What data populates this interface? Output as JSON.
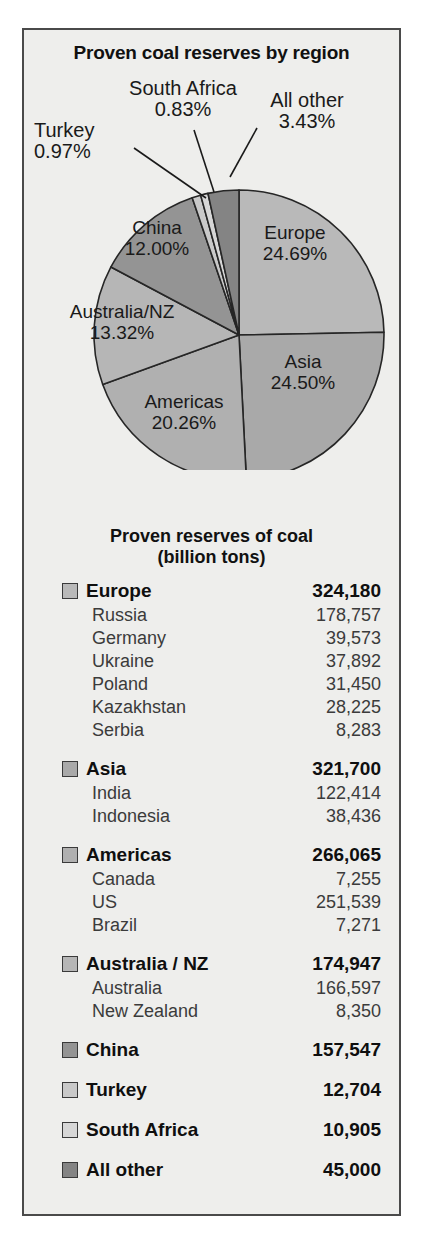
{
  "panel": {
    "background": "#eeeeec",
    "border_color": "#4a4a4a"
  },
  "pie_title": "Proven coal reserves by region",
  "table_title_line1": "Proven reserves of coal",
  "table_title_line2": "(billion tons)",
  "chart_data": {
    "type": "pie",
    "title": "Proven coal reserves by region",
    "unit": "%",
    "legend": "labels-on-slices-and-callouts",
    "start_angle_deg": 0,
    "direction": "clockwise",
    "labels": [
      "Europe",
      "Asia",
      "Americas",
      "Australia/NZ",
      "China",
      "Turkey",
      "South Africa",
      "All other"
    ],
    "values": [
      24.69,
      24.5,
      20.26,
      13.32,
      12.0,
      0.97,
      0.83,
      3.43
    ],
    "value_strings": [
      "24.69%",
      "24.50%",
      "20.26%",
      "13.32%",
      "12.00%",
      "0.97%",
      "0.83%",
      "3.43%"
    ],
    "colors": [
      "#b9b9b9",
      "#a9a9a9",
      "#b0b0b0",
      "#b6b6b6",
      "#949494",
      "#c9c9c9",
      "#d7d7d7",
      "#848484"
    ]
  },
  "slice_labels": [
    {
      "name": "Europe",
      "pct": "24.69%"
    },
    {
      "name": "Asia",
      "pct": "24.50%"
    },
    {
      "name": "Americas",
      "pct": "20.26%"
    },
    {
      "name": "Australia/NZ",
      "pct": "13.32%"
    },
    {
      "name": "China",
      "pct": "12.00%"
    }
  ],
  "callouts": [
    {
      "name": "South Africa",
      "pct": "0.83%"
    },
    {
      "name": "All other",
      "pct": "3.43%"
    },
    {
      "name": "Turkey",
      "pct": "0.97%"
    }
  ],
  "table": {
    "groups": [
      {
        "name": "Europe",
        "value": "324,180",
        "swatch": "#b9b9b9",
        "rows": [
          {
            "name": "Russia",
            "value": "178,757"
          },
          {
            "name": "Germany",
            "value": "39,573"
          },
          {
            "name": "Ukraine",
            "value": "37,892"
          },
          {
            "name": "Poland",
            "value": "31,450"
          },
          {
            "name": "Kazakhstan",
            "value": "28,225"
          },
          {
            "name": "Serbia",
            "value": "8,283"
          }
        ]
      },
      {
        "name": "Asia",
        "value": "321,700",
        "swatch": "#a9a9a9",
        "rows": [
          {
            "name": "India",
            "value": "122,414"
          },
          {
            "name": "Indonesia",
            "value": "38,436"
          }
        ]
      },
      {
        "name": "Americas",
        "value": "266,065",
        "swatch": "#b0b0b0",
        "rows": [
          {
            "name": "Canada",
            "value": "7,255"
          },
          {
            "name": "US",
            "value": "251,539"
          },
          {
            "name": "Brazil",
            "value": "7,271"
          }
        ]
      },
      {
        "name": "Australia / NZ",
        "value": "174,947",
        "swatch": "#b6b6b6",
        "rows": [
          {
            "name": "Australia",
            "value": "166,597"
          },
          {
            "name": "New Zealand",
            "value": "8,350"
          }
        ]
      },
      {
        "name": "China",
        "value": "157,547",
        "swatch": "#949494",
        "rows": []
      },
      {
        "name": "Turkey",
        "value": "12,704",
        "swatch": "#c9c9c9",
        "rows": []
      },
      {
        "name": "South Africa",
        "value": "10,905",
        "swatch": "#d7d7d7",
        "rows": []
      },
      {
        "name": "All other",
        "value": "45,000",
        "swatch": "#848484",
        "rows": []
      }
    ]
  }
}
